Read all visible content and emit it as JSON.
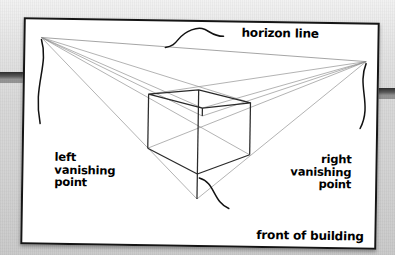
{
  "figure": {
    "type": "perspective-drawing-diagram",
    "labels": {
      "horizon": "horizon line",
      "left_vp": "left\nvanishing\npoint",
      "right_vp": "right\nvanishing\npoint",
      "front": "front of building"
    }
  },
  "colors": {
    "ink": "#151515",
    "construction_line": "#8d8d8d",
    "horizon_line": "#9a9a9a",
    "paper": "#ffffff",
    "background": "#d4d4d4",
    "page_edge": "#2e2e2e"
  },
  "geometry": {
    "left_vanishing_point": [
      16,
      18
    ],
    "right_vanishing_point": [
      341,
      37
    ],
    "horizon_line": {
      "x1": 16,
      "y1": 18,
      "x2": 341,
      "y2": 37
    },
    "building": {
      "front_top": [
        174,
        68
      ],
      "front_bottom": [
        174,
        152
      ],
      "left_top": [
        124,
        73
      ],
      "left_bottom": [
        124,
        127
      ],
      "right_top": [
        226,
        80
      ],
      "right_bottom": [
        226,
        132
      ],
      "back_top": [
        178,
        86
      ],
      "back_bottom": [
        178,
        94
      ]
    },
    "ground_apex": [
      174,
      177
    ],
    "left_rays_count": 5,
    "right_rays_count": 5
  },
  "leaders": {
    "horizon": "curved S-leader from label down-left to horizon line",
    "left_vp": "curved leader from left vanishing point down to left label",
    "right_vp": "curved leader from right vanishing point down to right label",
    "front": "curved S-leader from front bottom edge to front label"
  }
}
